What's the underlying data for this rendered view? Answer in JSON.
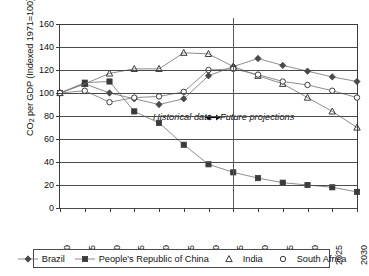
{
  "chart_data": {
    "type": "line",
    "title": "",
    "xlabel": "",
    "ylabel": "CO2 per GDP (Indexed 1971=100)",
    "ylabel_main": "CO",
    "ylabel_sub": "2",
    "ylabel_rest": " per GDP (Indexed 1971=100)",
    "x": [
      1970,
      1975,
      1980,
      1985,
      1990,
      1995,
      2000,
      2005,
      2010,
      2015,
      2020,
      2025,
      2030
    ],
    "xticks": [
      "1970",
      "1975",
      "1980",
      "1985",
      "1990",
      "1995",
      "2000",
      "2005",
      "2010",
      "2015",
      "2020",
      "2025",
      "2030"
    ],
    "yticks": [
      0,
      20,
      40,
      60,
      80,
      100,
      120,
      140,
      160
    ],
    "ylim": [
      0,
      160
    ],
    "xlim": [
      1970,
      2030
    ],
    "grid": true,
    "legend_position": "bottom",
    "series": [
      {
        "name": "Brazil",
        "marker": "diamond",
        "values": [
          100,
          108,
          100,
          95,
          90,
          95,
          115,
          123,
          130,
          124,
          119,
          114,
          110
        ]
      },
      {
        "name": "People's Republic of China",
        "marker": "square",
        "values": [
          100,
          109,
          110,
          84,
          74,
          55,
          38,
          31,
          26,
          22,
          20,
          18,
          14
        ]
      },
      {
        "name": "India",
        "marker": "triangle",
        "values": [
          100,
          108,
          117,
          121,
          121,
          135,
          134,
          123,
          115,
          108,
          96,
          84,
          70
        ]
      },
      {
        "name": "South Africa",
        "marker": "circle",
        "values": [
          100,
          102,
          92,
          96,
          97,
          101,
          120,
          121,
          116,
          110,
          107,
          102,
          96
        ]
      }
    ],
    "annotations": [
      {
        "text": "Historical data",
        "id": "historical-data-annotation"
      },
      {
        "text": "Future projections",
        "id": "future-projections-annotation"
      }
    ],
    "divider_year": 2005,
    "colors": {
      "axis": "#3b3b3b",
      "grid": "#4a4a4a",
      "series_line": "#808080",
      "marker": "#3a3a3a"
    }
  }
}
